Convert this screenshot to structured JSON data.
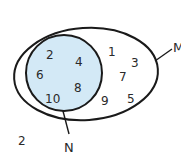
{
  "diagram": {
    "type": "venn",
    "colors": {
      "outline": "#1a1a1a",
      "set_n_fill": "#d3e9f6",
      "text": "#2a2a2a",
      "background": "#ffffff"
    },
    "sets": {
      "M": {
        "label": "M",
        "elements_only_m": [
          "1",
          "3",
          "7",
          "9",
          "5"
        ]
      },
      "N": {
        "label": "N",
        "elements": [
          "2",
          "4",
          "6",
          "8",
          "10"
        ]
      }
    },
    "outside": {
      "elements": [
        "2"
      ]
    }
  }
}
